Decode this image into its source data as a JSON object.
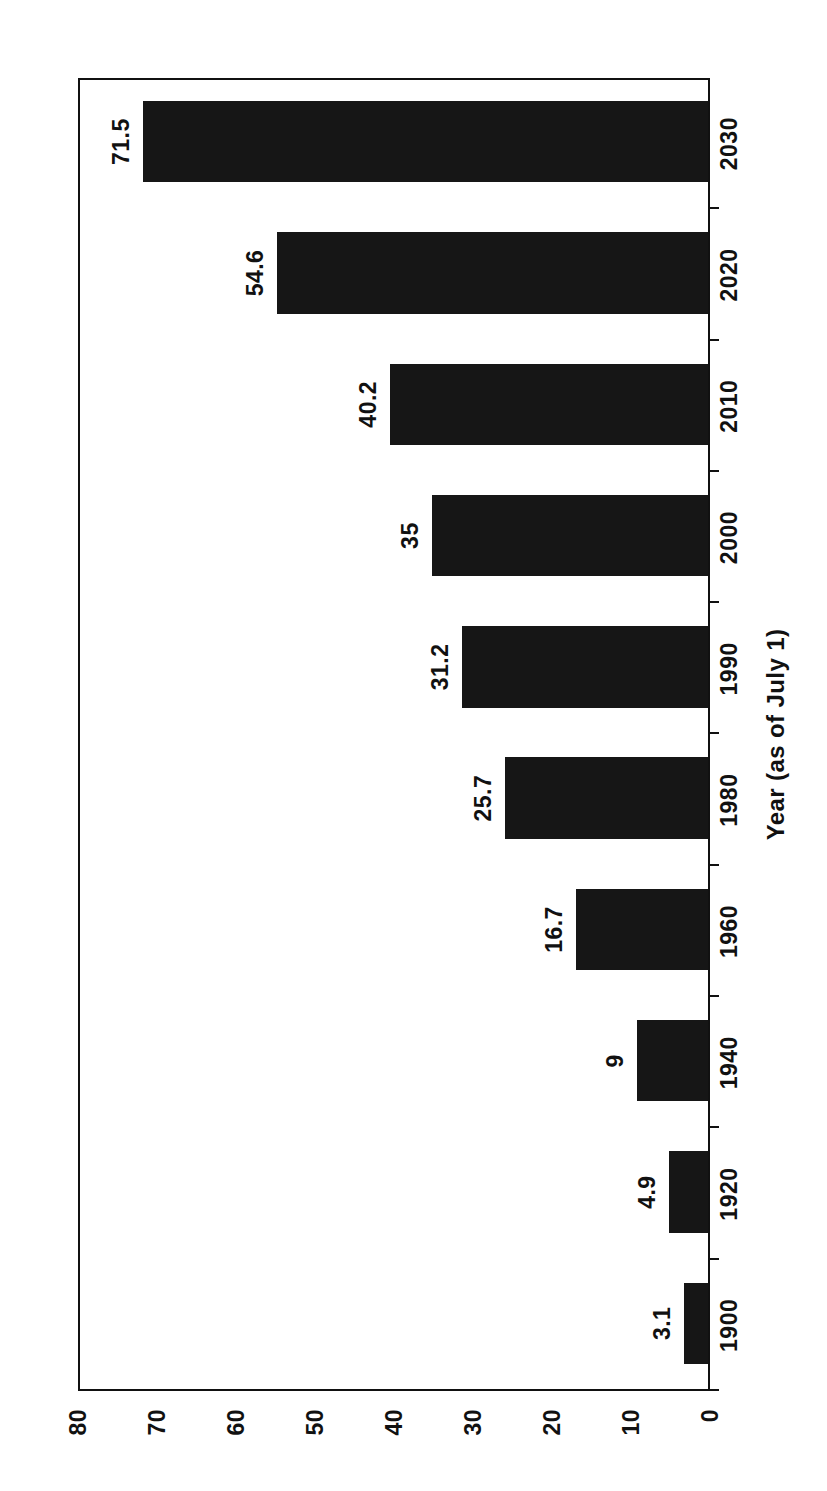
{
  "chart_data": {
    "type": "bar",
    "orientation": "vertical-bars-on-rotated-page",
    "title": "",
    "subtitle": "",
    "xlabel": "Year (as of July 1)",
    "ylabel": "",
    "categories": [
      "1900",
      "1920",
      "1940",
      "1960",
      "1980",
      "1990",
      "2000",
      "2010",
      "2020",
      "2030"
    ],
    "values": [
      3.1,
      4.9,
      9,
      16.7,
      25.7,
      31.2,
      35,
      40.2,
      54.6,
      71.5
    ],
    "data_labels": [
      "3.1",
      "4.9",
      "9",
      "16.7",
      "25.7",
      "31.2",
      "35",
      "40.2",
      "54.6",
      "71.5"
    ],
    "ylim": [
      0,
      80
    ],
    "y_ticks": [
      0,
      10,
      20,
      30,
      40,
      50,
      60,
      70,
      80
    ],
    "y_tick_labels": [
      "0",
      "10",
      "20",
      "30",
      "40",
      "50",
      "60",
      "70",
      "80"
    ],
    "grid": false,
    "legend": null,
    "legend_position": "none",
    "bar_color": "#161616",
    "axis_color": "#111111",
    "background_color": "#ffffff",
    "page_rotation_degrees": -90
  },
  "figure": {
    "axis_title": "Year (as of July 1)"
  }
}
